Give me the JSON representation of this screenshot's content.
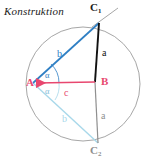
{
  "figure": {
    "title": "Konstruktion",
    "width": 158,
    "height": 158,
    "background": "#ffffff"
  },
  "colors": {
    "circle": "#9c9c9c",
    "construction_ray": "#9c9c9c",
    "segment_ab": "#e8476f",
    "segment_b_upper": "#2f7fc4",
    "segment_a_upper": "#111111",
    "segment_b_lower": "#a8d8ea",
    "segment_a_lower": "#8f8f8f",
    "angle_arc_upper": "#2f7fc4",
    "angle_arc_lower": "#a8d8ea",
    "label_dark": "#1a1a1a",
    "label_gray": "#8f8f8f"
  },
  "points": {
    "A": {
      "label": "A",
      "x": 33,
      "y": 83,
      "color": "#e8476f"
    },
    "B": {
      "label": "B",
      "x": 95,
      "y": 82,
      "color": "#e8476f"
    },
    "C1": {
      "label": "C",
      "sub": "1",
      "x": 99,
      "y": 21,
      "color": "#1a1a1a"
    },
    "C2": {
      "label": "C",
      "sub": "2",
      "x": 98,
      "y": 143,
      "color": "#8f8f8f"
    }
  },
  "circle": {
    "name": "circumscribed-arc",
    "cx": 83,
    "cy": 84,
    "r": 57
  },
  "segments": [
    {
      "name": "segment-ab",
      "from": "A",
      "to": "B",
      "label": "c",
      "color": "#e8476f",
      "width": 1.6
    },
    {
      "name": "segment-b-upper",
      "from": "A",
      "to": "C1",
      "label": "b",
      "color": "#2f7fc4",
      "width": 1.6
    },
    {
      "name": "segment-a-upper",
      "from": "B",
      "to": "C1",
      "label": "a",
      "color": "#111111",
      "width": 1.8
    },
    {
      "name": "segment-b-lower",
      "from": "A",
      "to": "C2",
      "label": "b",
      "color": "#a8d8ea",
      "width": 1.4
    },
    {
      "name": "segment-a-lower",
      "from": "B",
      "to": "C2",
      "label": "a",
      "color": "#8f8f8f",
      "width": 1.2
    }
  ],
  "side_labels": [
    {
      "name": "side-label-b-upper",
      "text": "b",
      "x": 57,
      "y": 49,
      "color": "#2f7fc4"
    },
    {
      "name": "side-label-a-upper",
      "text": "a",
      "x": 102,
      "y": 48,
      "color": "#111111"
    },
    {
      "name": "side-label-c",
      "text": "c",
      "x": 64,
      "y": 90,
      "color": "#e8476f"
    },
    {
      "name": "side-label-b-lower",
      "text": "b",
      "x": 62,
      "y": 117,
      "color": "#a8d8ea"
    },
    {
      "name": "side-label-a-lower",
      "text": "a",
      "x": 101,
      "y": 114,
      "color": "#8f8f8f"
    }
  ],
  "angles": [
    {
      "name": "angle-alpha-upper",
      "text": "α",
      "x": 45,
      "y": 72,
      "color": "#2f7fc4"
    },
    {
      "name": "angle-alpha-lower",
      "text": "α",
      "x": 45,
      "y": 88,
      "color": "#7fbcd8"
    }
  ],
  "construction_ray": {
    "name": "construction-ray",
    "x1": 92,
    "y1": 27,
    "x2": 118,
    "y2": 8,
    "color": "#9c9c9c"
  },
  "arrow_marker": {
    "name": "arrowhead-at-a",
    "color": "#e8476f"
  }
}
